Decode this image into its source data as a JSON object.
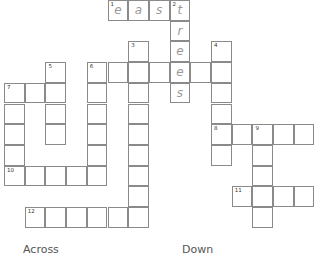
{
  "puzzle": {
    "cell_size": 20.7,
    "origin_x": 4,
    "origin_y": 0,
    "cells": [
      {
        "r": 0,
        "c": 5,
        "num": "1",
        "letter": "e"
      },
      {
        "r": 0,
        "c": 6,
        "letter": "a"
      },
      {
        "r": 0,
        "c": 7,
        "letter": "s"
      },
      {
        "r": 0,
        "c": 8,
        "num": "2",
        "letter": "t"
      },
      {
        "r": 1,
        "c": 8,
        "letter": "r"
      },
      {
        "r": 2,
        "c": 6,
        "num": "3"
      },
      {
        "r": 2,
        "c": 8,
        "letter": "e"
      },
      {
        "r": 2,
        "c": 10,
        "num": "4"
      },
      {
        "r": 3,
        "c": 2,
        "num": "5"
      },
      {
        "r": 3,
        "c": 4,
        "num": "6"
      },
      {
        "r": 3,
        "c": 5
      },
      {
        "r": 3,
        "c": 6
      },
      {
        "r": 3,
        "c": 7
      },
      {
        "r": 3,
        "c": 8,
        "letter": "e"
      },
      {
        "r": 3,
        "c": 9
      },
      {
        "r": 3,
        "c": 10
      },
      {
        "r": 4,
        "c": 0,
        "num": "7"
      },
      {
        "r": 4,
        "c": 1
      },
      {
        "r": 4,
        "c": 2
      },
      {
        "r": 4,
        "c": 4
      },
      {
        "r": 4,
        "c": 6
      },
      {
        "r": 4,
        "c": 8,
        "letter": "s"
      },
      {
        "r": 4,
        "c": 10
      },
      {
        "r": 5,
        "c": 0
      },
      {
        "r": 5,
        "c": 2
      },
      {
        "r": 5,
        "c": 4
      },
      {
        "r": 5,
        "c": 6
      },
      {
        "r": 5,
        "c": 10
      },
      {
        "r": 6,
        "c": 0
      },
      {
        "r": 6,
        "c": 2
      },
      {
        "r": 6,
        "c": 4
      },
      {
        "r": 6,
        "c": 6
      },
      {
        "r": 6,
        "c": 10,
        "num": "8"
      },
      {
        "r": 6,
        "c": 11
      },
      {
        "r": 6,
        "c": 12,
        "num": "9"
      },
      {
        "r": 6,
        "c": 13
      },
      {
        "r": 6,
        "c": 14
      },
      {
        "r": 7,
        "c": 0
      },
      {
        "r": 7,
        "c": 4
      },
      {
        "r": 7,
        "c": 6
      },
      {
        "r": 7,
        "c": 10
      },
      {
        "r": 7,
        "c": 12
      },
      {
        "r": 8,
        "c": 0,
        "num": "10"
      },
      {
        "r": 8,
        "c": 1
      },
      {
        "r": 8,
        "c": 2
      },
      {
        "r": 8,
        "c": 3
      },
      {
        "r": 8,
        "c": 4
      },
      {
        "r": 8,
        "c": 6
      },
      {
        "r": 8,
        "c": 12
      },
      {
        "r": 9,
        "c": 6
      },
      {
        "r": 9,
        "c": 11,
        "num": "11"
      },
      {
        "r": 9,
        "c": 12
      },
      {
        "r": 9,
        "c": 13
      },
      {
        "r": 9,
        "c": 14
      },
      {
        "r": 10,
        "c": 1,
        "num": "12"
      },
      {
        "r": 10,
        "c": 2
      },
      {
        "r": 10,
        "c": 3
      },
      {
        "r": 10,
        "c": 4
      },
      {
        "r": 10,
        "c": 5
      },
      {
        "r": 10,
        "c": 6
      },
      {
        "r": 10,
        "c": 12
      }
    ]
  },
  "headings": {
    "across": "Across",
    "down": "Down"
  }
}
